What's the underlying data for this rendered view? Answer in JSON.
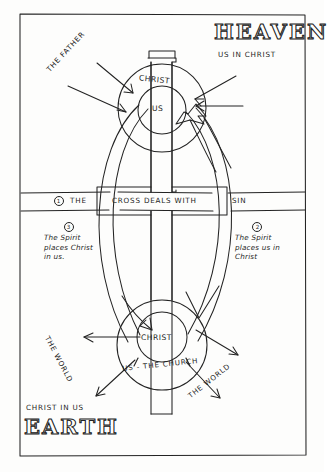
{
  "document": {
    "kind": "hand-drawn-diagram",
    "title": "Heaven and Earth cross diagram",
    "ink_color": "#232323",
    "paper_color": "#fdfdfc"
  },
  "regions": {
    "upper": {
      "name": "HEAVEN",
      "subtitle": "US IN CHRIST"
    },
    "lower": {
      "name": "EARTH",
      "subtitle": "CHRIST IN US"
    }
  },
  "band": {
    "left_text": "THE",
    "left_marker": "1",
    "center_text": "CROSS DEALS WITH",
    "right_text": "SIN",
    "full_sentence": "THE CROSS DEALS WITH SIN"
  },
  "notes": [
    {
      "marker": "3",
      "lines": [
        "The Spirit",
        "places Christ",
        "in us."
      ]
    },
    {
      "marker": "2",
      "lines": [
        "The Spirit",
        "places us in",
        "Christ"
      ]
    }
  ],
  "upper_circle": {
    "outer_label": "CHRIST",
    "inner_label": "US"
  },
  "lower_circle": {
    "inner_label": "CHRIST",
    "outer_label": "US - THE CHURCH"
  },
  "labels": {
    "father": "THE FATHER",
    "world_left": "THE WORLD",
    "world_right": "THE WORLD"
  },
  "arrows": {
    "father_to_christ": 2,
    "into_upper_circle_right": 2,
    "church_outward": 3
  }
}
